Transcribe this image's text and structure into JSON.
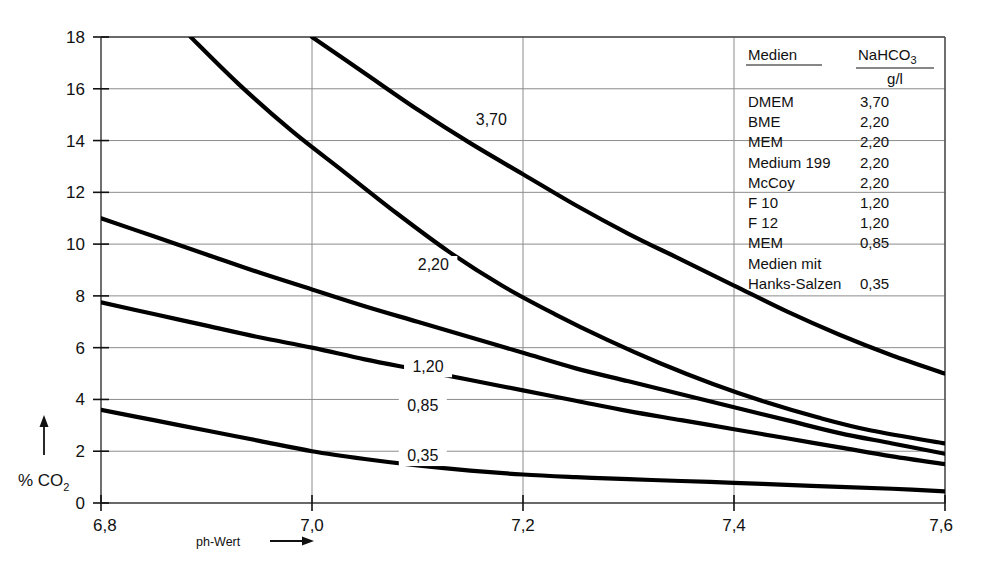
{
  "chart_data": {
    "type": "line",
    "title": "",
    "xlabel": "ph-Wert",
    "ylabel": "% CO2",
    "ylabel_display": "% CO",
    "ylabel_sub": "2",
    "xlim": [
      6.8,
      7.6
    ],
    "ylim": [
      0,
      18
    ],
    "grid": true,
    "x_ticks": [
      "6,8",
      "7,0",
      "7,2",
      "7,4",
      "7,6"
    ],
    "x_tick_values": [
      6.8,
      7.0,
      7.2,
      7.4,
      7.6
    ],
    "y_ticks": [
      "0",
      "2",
      "4",
      "6",
      "8",
      "10",
      "12",
      "14",
      "16",
      "18"
    ],
    "y_tick_values": [
      0,
      2,
      4,
      6,
      8,
      10,
      12,
      14,
      16,
      18
    ],
    "legend_position": "top-right",
    "series": [
      {
        "name": "3,70",
        "label": "3,70",
        "label_x": 7.17,
        "label_y": 14.6,
        "x": [
          7.0,
          7.05,
          7.1,
          7.15,
          7.2,
          7.25,
          7.3,
          7.35,
          7.4,
          7.45,
          7.5,
          7.55,
          7.6
        ],
        "y": [
          18.0,
          16.6,
          15.2,
          13.9,
          12.7,
          11.5,
          10.4,
          9.4,
          8.4,
          7.4,
          6.5,
          5.7,
          5.0
        ]
      },
      {
        "name": "2,20",
        "label": "2,20",
        "label_x": 7.115,
        "label_y": 9.0,
        "x": [
          6.885,
          6.93,
          6.98,
          7.03,
          7.08,
          7.13,
          7.18,
          7.23,
          7.28,
          7.33,
          7.38,
          7.43,
          7.48,
          7.53,
          7.6
        ],
        "y": [
          18.0,
          16.2,
          14.4,
          12.8,
          11.2,
          9.7,
          8.4,
          7.3,
          6.3,
          5.4,
          4.6,
          3.9,
          3.3,
          2.8,
          2.3
        ]
      },
      {
        "name": "1,20",
        "label": "1,20",
        "label_x": 7.11,
        "label_y": 5.05,
        "x": [
          6.8,
          6.85,
          6.9,
          6.95,
          7.0,
          7.05,
          7.1,
          7.15,
          7.2,
          7.25,
          7.3,
          7.35,
          7.4,
          7.45,
          7.5,
          7.55,
          7.6
        ],
        "y": [
          11.0,
          10.3,
          9.6,
          8.9,
          8.25,
          7.6,
          7.0,
          6.4,
          5.8,
          5.2,
          4.7,
          4.2,
          3.7,
          3.2,
          2.7,
          2.3,
          1.9
        ]
      },
      {
        "name": "0,85",
        "label": "0,85",
        "label_x": 7.105,
        "label_y": 3.55,
        "x": [
          6.8,
          6.85,
          6.9,
          6.95,
          7.0,
          7.05,
          7.1,
          7.15,
          7.2,
          7.25,
          7.3,
          7.35,
          7.4,
          7.45,
          7.5,
          7.55,
          7.6
        ],
        "y": [
          7.75,
          7.3,
          6.85,
          6.4,
          6.0,
          5.55,
          5.15,
          4.75,
          4.35,
          3.95,
          3.55,
          3.2,
          2.85,
          2.5,
          2.15,
          1.8,
          1.5
        ]
      },
      {
        "name": "0,35",
        "label": "0,35",
        "label_x": 7.105,
        "label_y": 1.62,
        "x": [
          6.8,
          6.85,
          6.9,
          6.95,
          7.0,
          7.05,
          7.1,
          7.15,
          7.2,
          7.25,
          7.3,
          7.35,
          7.4,
          7.45,
          7.5,
          7.55,
          7.6
        ],
        "y": [
          3.6,
          3.2,
          2.8,
          2.4,
          2.0,
          1.7,
          1.45,
          1.25,
          1.1,
          1.0,
          0.92,
          0.85,
          0.78,
          0.7,
          0.62,
          0.55,
          0.45
        ]
      }
    ]
  },
  "legend": {
    "header_media": "Medien",
    "header_compound": "NaHCO",
    "header_compound_sub": "3",
    "header_unit": "g/l",
    "rows": [
      {
        "medium": "DMEM",
        "value": "3,70"
      },
      {
        "medium": "BME",
        "value": "2,20"
      },
      {
        "medium": "MEM",
        "value": "2,20"
      },
      {
        "medium": "Medium 199",
        "value": "2,20"
      },
      {
        "medium": "McCoy",
        "value": "2,20"
      },
      {
        "medium": "F 10",
        "value": "1,20"
      },
      {
        "medium": "F 12",
        "value": "1,20"
      },
      {
        "medium": "MEM",
        "value": "0,85"
      },
      {
        "medium": "Medien mit",
        "value": ""
      },
      {
        "medium": "Hanks-Salzen",
        "value": "0,35"
      }
    ]
  },
  "colors": {
    "curve": "#000000",
    "grid": "#8c8c8c",
    "frame": "#4a4a4a",
    "text": "#111111",
    "background": "#ffffff"
  }
}
